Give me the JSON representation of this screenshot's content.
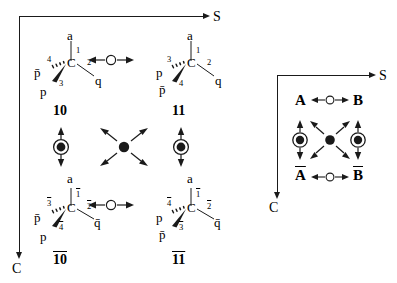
{
  "figure": {
    "axes": {
      "horizontal_label": "S",
      "vertical_label": "C"
    },
    "left_panel": {
      "structures": [
        {
          "id": "10",
          "label": "10",
          "center_atom": "C",
          "substituents": [
            {
              "position": "top",
              "atom": "a",
              "locant": "1",
              "bond": "plain"
            },
            {
              "position": "right",
              "atom": "q",
              "locant": "2",
              "bond": "plain"
            },
            {
              "position": "lower-left",
              "atom": "p",
              "locant": "3",
              "bond": "wedge"
            },
            {
              "position": "upper-left",
              "atom": "p̄",
              "locant": "4",
              "bond": "hash"
            }
          ]
        },
        {
          "id": "11",
          "label": "11",
          "center_atom": "C",
          "substituents": [
            {
              "position": "top",
              "atom": "a",
              "locant": "1",
              "bond": "plain"
            },
            {
              "position": "right",
              "atom": "q",
              "locant": "2",
              "bond": "plain"
            },
            {
              "position": "upper-left",
              "atom": "p",
              "locant": "3",
              "bond": "hash"
            },
            {
              "position": "lower-left",
              "atom": "p̄",
              "locant": "4",
              "bond": "wedge"
            }
          ]
        },
        {
          "id": "10bar",
          "label": "10",
          "label_overline": true,
          "center_atom": "C",
          "substituents": [
            {
              "position": "top",
              "atom": "a",
              "locant": "1",
              "locant_overline": true,
              "bond": "plain"
            },
            {
              "position": "right",
              "atom": "q̄",
              "locant": "2",
              "locant_overline": true,
              "bond": "plain"
            },
            {
              "position": "upper-left",
              "atom": "p̄",
              "locant": "3",
              "locant_overline": true,
              "bond": "hash"
            },
            {
              "position": "lower-left",
              "atom": "p",
              "locant": "4",
              "locant_overline": true,
              "bond": "wedge"
            }
          ]
        },
        {
          "id": "11bar",
          "label": "11",
          "label_overline": true,
          "center_atom": "C",
          "substituents": [
            {
              "position": "top",
              "atom": "a",
              "locant": "1",
              "locant_overline": true,
              "bond": "plain"
            },
            {
              "position": "right",
              "atom": "q̄",
              "locant": "2",
              "locant_overline": true,
              "bond": "plain"
            },
            {
              "position": "upper-left",
              "atom": "p",
              "locant": "4",
              "locant_overline": true,
              "bond": "hash"
            },
            {
              "position": "lower-left",
              "atom": "p̄",
              "locant": "3",
              "locant_overline": true,
              "bond": "wedge"
            }
          ]
        }
      ],
      "operators": {
        "horizontal_top": "open-circle-double-arrow",
        "horizontal_bottom": "open-circle-double-arrow",
        "vertical_left": "filled-circled-dot-double-arrow",
        "vertical_right": "filled-circled-dot-double-arrow",
        "diagonal_center": "filled-dot-four-arrow"
      }
    },
    "right_panel": {
      "corners": [
        {
          "position": "top-left",
          "label": "A",
          "overline": false
        },
        {
          "position": "top-right",
          "label": "B",
          "overline": false
        },
        {
          "position": "bottom-left",
          "label": "A",
          "overline": true
        },
        {
          "position": "bottom-right",
          "label": "B",
          "overline": true
        }
      ],
      "operators": {
        "horizontal_top": "open-circle-double-arrow",
        "horizontal_bottom": "open-circle-double-arrow",
        "vertical_left": "filled-circled-dot-double-arrow",
        "vertical_right": "filled-circled-dot-double-arrow",
        "diagonal_center": "filled-dot-four-arrow"
      }
    },
    "colors": {
      "ink": "#1a1a1a",
      "background": "#ffffff"
    }
  }
}
